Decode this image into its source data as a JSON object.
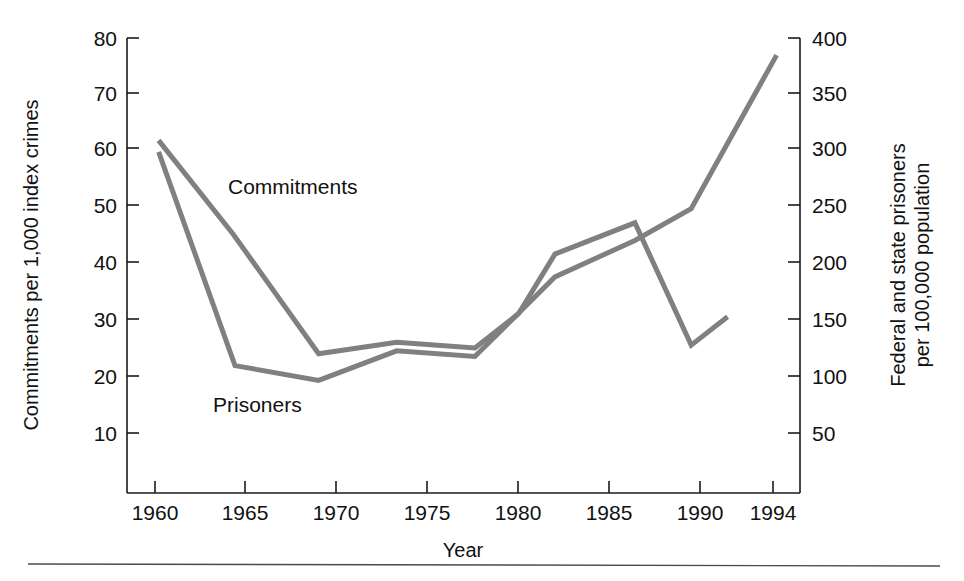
{
  "chart_data": {
    "type": "line",
    "title": "",
    "xlabel": "Year",
    "ylabel": "Commitments per 1,000 index crimes",
    "y2label": "Federal and state prisoners per 100,000 population",
    "xlim": [
      1959,
      1995.5
    ],
    "ylim": [
      0,
      80
    ],
    "y2lim": [
      0,
      400
    ],
    "grid": false,
    "legend": "inline-annotations",
    "xticks": [
      1960,
      1965,
      1970,
      1975,
      1980,
      1985,
      1990,
      1994
    ],
    "xticklabels": [
      "1960",
      "1965",
      "1970",
      "1975",
      "1980",
      "1985",
      "1990",
      "1994"
    ],
    "yticks": [
      10,
      20,
      30,
      40,
      50,
      60,
      70,
      80
    ],
    "yticklabels": [
      "10",
      "20",
      "30",
      "40",
      "50",
      "60",
      "70",
      "80"
    ],
    "y2ticks": [
      50,
      100,
      150,
      200,
      250,
      300,
      350,
      400
    ],
    "y2ticklabels": [
      "50",
      "100",
      "150",
      "200",
      "250",
      "300",
      "350",
      "400"
    ],
    "line_color": "#808080",
    "series": [
      {
        "name": "Commitments",
        "axis": "left",
        "units": "commitments per 1,000 index crimes",
        "x": [
          1960.2,
          1964.3,
          1969.0,
          1973.3,
          1977.6,
          1980.0,
          1982.0,
          1986.4,
          1989.5,
          1991.5
        ],
        "values": [
          62.0,
          45.5,
          24.5,
          26.5,
          25.5,
          31.5,
          42.0,
          47.5,
          26.0,
          31.0
        ]
      },
      {
        "name": "Prisoners",
        "axis": "right",
        "units": "federal and state prisoners per 100,000 population",
        "x": [
          1960.2,
          1964.4,
          1969.0,
          1973.3,
          1977.6,
          1980.0,
          1982.0,
          1986.4,
          1989.5,
          1994.2
        ],
        "values": [
          300,
          112,
          99,
          125,
          120,
          158,
          190,
          222,
          250,
          385
        ],
        "values_left_axis_equivalent": [
          60.0,
          22.4,
          19.8,
          25.0,
          24.0,
          31.6,
          38.0,
          44.4,
          50.0,
          77.0
        ]
      }
    ],
    "annotations": [
      {
        "text": "Commitments",
        "x_px": 228,
        "y_px": 194
      },
      {
        "text": "Prisoners",
        "x_px": 213,
        "y_px": 412
      }
    ]
  },
  "axes": {
    "x_title": "Year",
    "y_left_title_line1": "Commitments per 1,000 index crimes",
    "y_right_title_line1": "Federal and state prisoners",
    "y_right_title_line2": "per 100,000 population"
  },
  "labels": {
    "commitments": "Commitments",
    "prisoners": "Prisoners"
  },
  "ticks": {
    "left": [
      "80",
      "70",
      "60",
      "50",
      "40",
      "30",
      "20",
      "10"
    ],
    "right": [
      "400",
      "350",
      "300",
      "250",
      "200",
      "150",
      "100",
      "50"
    ],
    "bottom": [
      "1960",
      "1965",
      "1970",
      "1975",
      "1980",
      "1985",
      "1990",
      "1994"
    ]
  }
}
